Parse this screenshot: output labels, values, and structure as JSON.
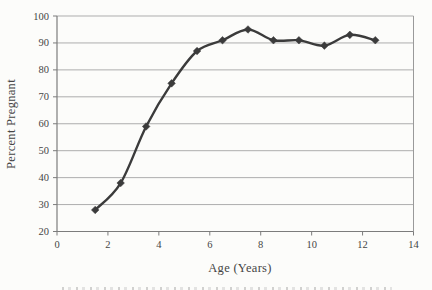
{
  "chart_data": {
    "type": "line",
    "title": "",
    "xlabel": "Age (Years)",
    "ylabel": "Percent Pregnant",
    "x": [
      1.5,
      2.5,
      3.5,
      4.5,
      5.5,
      6.5,
      7.5,
      8.5,
      9.5,
      10.5,
      11.5,
      12.5
    ],
    "y": [
      28,
      38,
      59,
      75,
      87,
      91,
      95,
      91,
      91,
      89,
      93,
      91
    ],
    "xlim": [
      0,
      14
    ],
    "ylim": [
      20,
      100
    ],
    "x_ticks": [
      0,
      2,
      4,
      6,
      8,
      10,
      12,
      14
    ],
    "y_ticks": [
      20,
      30,
      40,
      50,
      60,
      70,
      80,
      90,
      100
    ],
    "grid": "horizontal",
    "legend": "none",
    "marker": "diamond",
    "line_smoothed": true,
    "colors": {
      "series": "#3b3b3b",
      "gridline": "#adadad",
      "axis": "#7c7c7c",
      "plot_border": "#9a9a9a",
      "text": "#454545",
      "background": "#fcfcfa"
    }
  }
}
